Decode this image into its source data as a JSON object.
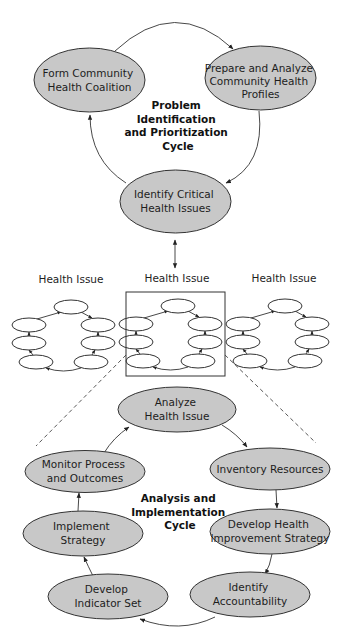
{
  "upper_cycle": {
    "label": [
      "Problem",
      "Identification",
      "and Prioritization",
      "Cycle"
    ],
    "nodes": [
      {
        "id": "form",
        "lines": [
          "Form Community",
          "Health Coalition"
        ]
      },
      {
        "id": "prepare",
        "lines": [
          "Prepare and Analyze",
          "Community Health",
          "Profiles"
        ]
      },
      {
        "id": "identify",
        "lines": [
          "Identify Critical",
          "Health Issues"
        ]
      }
    ]
  },
  "health_issues": {
    "labels": [
      "Health Issue",
      "Health Issue",
      "Health Issue"
    ],
    "selected_index": 1
  },
  "lower_cycle": {
    "label": [
      "Analysis and",
      "Implementation",
      "Cycle"
    ],
    "nodes": [
      {
        "id": "analyze",
        "lines": [
          "Analyze",
          "Health Issue"
        ]
      },
      {
        "id": "inventory",
        "lines": [
          "Inventory Resources"
        ]
      },
      {
        "id": "develop-strategy",
        "lines": [
          "Develop Health",
          "Improvement Strategy"
        ]
      },
      {
        "id": "accountability",
        "lines": [
          "Identify",
          "Accountability"
        ]
      },
      {
        "id": "indicator",
        "lines": [
          "Develop",
          "Indicator Set"
        ]
      },
      {
        "id": "implement",
        "lines": [
          "Implement",
          "Strategy"
        ]
      },
      {
        "id": "monitor",
        "lines": [
          "Monitor Process",
          "and Outcomes"
        ]
      }
    ]
  },
  "colors": {
    "node_fill": "#c8c8c8",
    "stroke": "#333333"
  }
}
